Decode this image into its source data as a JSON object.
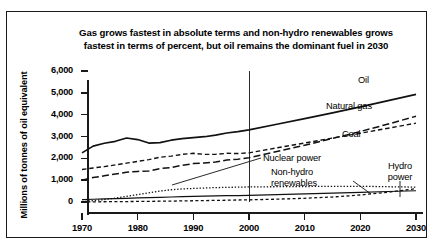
{
  "chart_data": {
    "type": "line",
    "title": "Gas grows fastest in absolute terms and non-hydro renewables grows fastest in terms of percent, but oil remains the dominant fuel in 2030",
    "xlabel": "",
    "ylabel": "Millions of tonnes of oil equivalent",
    "xlim": [
      1970,
      2030
    ],
    "ylim": [
      0,
      6000
    ],
    "xticks": [
      "1970",
      "1980",
      "1990",
      "2000",
      "2010",
      "2020",
      "2030"
    ],
    "yticks": [
      "0",
      "1,000",
      "2,000",
      "3,000",
      "4,000",
      "5,000",
      "6,000"
    ],
    "grid": false,
    "legend_position": "inline-right",
    "annotations": [
      {
        "text": "Oil",
        "year": 2024,
        "value": 5150
      },
      {
        "text": "Natural gas",
        "year": 2023,
        "value": 4050
      },
      {
        "text": "Coal",
        "year": 2023,
        "value": 3080
      },
      {
        "text": "Nuclear power",
        "year": 2011,
        "value": 1480
      },
      {
        "text": "Non-hydro renewables",
        "year": 2013,
        "value": 880
      },
      {
        "text": "Hydro power",
        "year": 2026,
        "value": 930
      }
    ],
    "divider_year": 2000,
    "x": [
      1970,
      1972,
      1974,
      1976,
      1978,
      1980,
      1982,
      1984,
      1986,
      1988,
      1990,
      1992,
      1994,
      1996,
      1998,
      2000,
      2005,
      2010,
      2015,
      2020,
      2025,
      2030
    ],
    "series": [
      {
        "name": "Oil",
        "style": "solid-thick",
        "values": [
          2250,
          2560,
          2690,
          2780,
          2930,
          2860,
          2700,
          2720,
          2830,
          2900,
          2950,
          2990,
          3060,
          3160,
          3220,
          3300,
          3560,
          3820,
          4080,
          4360,
          4640,
          4930
        ]
      },
      {
        "name": "Natural gas",
        "style": "dashed-long",
        "values": [
          1000,
          1120,
          1200,
          1280,
          1360,
          1400,
          1420,
          1530,
          1580,
          1680,
          1760,
          1790,
          1830,
          1920,
          1960,
          2030,
          2310,
          2600,
          2910,
          3230,
          3570,
          3930
        ]
      },
      {
        "name": "Coal",
        "style": "dashed-medium",
        "values": [
          1490,
          1560,
          1620,
          1700,
          1780,
          1860,
          1940,
          2050,
          2100,
          2180,
          2230,
          2180,
          2180,
          2230,
          2220,
          2250,
          2480,
          2700,
          2930,
          3150,
          3380,
          3610
        ]
      },
      {
        "name": "Nuclear power",
        "style": "dotted",
        "values": [
          20,
          60,
          110,
          180,
          260,
          340,
          420,
          500,
          560,
          600,
          620,
          640,
          660,
          670,
          680,
          690,
          700,
          710,
          715,
          720,
          700,
          680
        ]
      },
      {
        "name": "Non-hydro renewables",
        "style": "dashed-short",
        "values": [
          5,
          8,
          12,
          16,
          20,
          25,
          30,
          36,
          42,
          50,
          58,
          66,
          74,
          82,
          92,
          100,
          130,
          170,
          230,
          320,
          450,
          610
        ]
      },
      {
        "name": "Hydro power",
        "style": "solid-thin",
        "values": [
          110,
          125,
          140,
          155,
          170,
          185,
          200,
          215,
          230,
          245,
          258,
          268,
          278,
          288,
          296,
          305,
          340,
          375,
          410,
          445,
          480,
          515
        ]
      }
    ]
  }
}
